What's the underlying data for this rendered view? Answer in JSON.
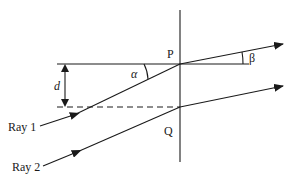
{
  "diagram": {
    "type": "ray-optics-refraction",
    "labels": {
      "point_p": "P",
      "point_q": "Q",
      "alpha": "α",
      "beta": "β",
      "distance": "d",
      "ray1": "Ray 1",
      "ray2": "Ray 2"
    },
    "colors": {
      "stroke": "#1a1a1a",
      "background": "#ffffff"
    },
    "geometry": {
      "interface_x": 180,
      "interface_top": 10,
      "interface_bottom": 162,
      "p": [
        180,
        64
      ],
      "q": [
        180,
        107
      ],
      "ray1_start": [
        40,
        126
      ],
      "ray1_end": [
        283,
        44
      ],
      "ray2_start": [
        43,
        166
      ],
      "ray2_end": [
        283,
        86
      ],
      "horizontal_ref": [
        57,
        249
      ],
      "dashed_ref": [
        57,
        180
      ]
    }
  }
}
